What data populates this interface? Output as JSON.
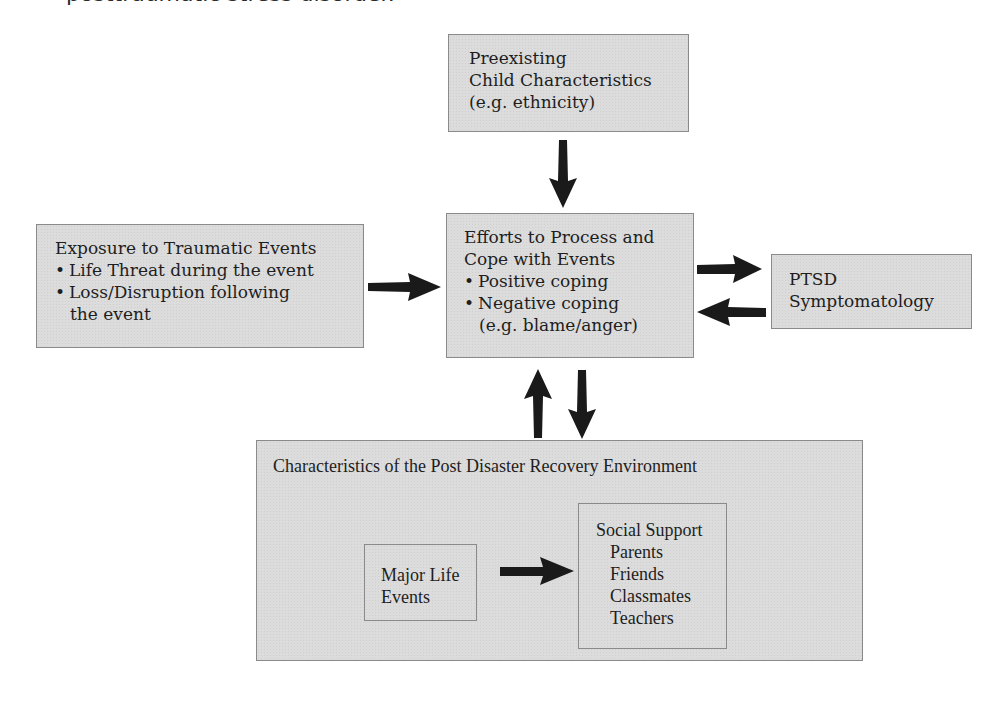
{
  "top_fragment": "posttraumatic stress disorder.",
  "boxes": {
    "preexisting": {
      "lines": [
        "Preexisting",
        "Child Characteristics",
        "(e.g. ethnicity)"
      ]
    },
    "exposure": {
      "title": "Exposure to Traumatic Events",
      "bullets": [
        "Life Threat during the event",
        "Loss/Disruption following"
      ],
      "continuation": "the event"
    },
    "efforts": {
      "lines": [
        "Efforts to Process and",
        "Cope with Events"
      ],
      "bullets": [
        "Positive coping",
        "Negative coping"
      ],
      "continuation": "(e.g. blame/anger)"
    },
    "ptsd": {
      "lines": [
        "PTSD",
        "Symptomatology"
      ]
    },
    "recovery": {
      "title": "Characteristics of the Post Disaster Recovery Environment",
      "major_life": {
        "lines": [
          "Major Life",
          "Events"
        ]
      },
      "social_support": {
        "title": "Social Support",
        "items": [
          "Parents",
          "Friends",
          "Classmates",
          "Teachers"
        ]
      }
    }
  },
  "arrows": [
    {
      "from": "preexisting",
      "to": "efforts",
      "direction": "down"
    },
    {
      "from": "exposure",
      "to": "efforts",
      "direction": "right"
    },
    {
      "from": "efforts",
      "to": "ptsd",
      "direction": "right"
    },
    {
      "from": "ptsd",
      "to": "efforts",
      "direction": "left"
    },
    {
      "from": "recovery",
      "to": "efforts",
      "direction": "up"
    },
    {
      "from": "efforts",
      "to": "recovery",
      "direction": "down"
    },
    {
      "from": "major_life",
      "to": "social_support",
      "direction": "right"
    }
  ],
  "colors": {
    "box_fill": "#dcdcdc",
    "box_border": "#8a8a8a",
    "arrow": "#1a1a1a",
    "text": "#1e1e1e"
  }
}
